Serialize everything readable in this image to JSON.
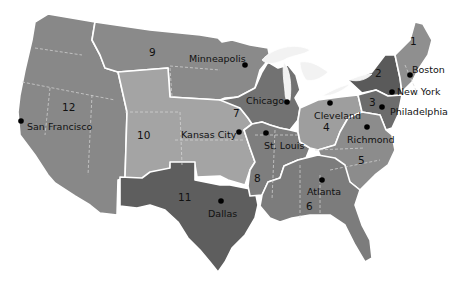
{
  "map": {
    "title": "Federal Reserve Districts",
    "colors": {
      "d1": "#8f8f8f",
      "d2": "#5a5a5a",
      "d3": "#6c6c6c",
      "d4": "#9e9e9e",
      "d5": "#8c8c8c",
      "d6": "#7c7c7c",
      "d7": "#727272",
      "d8": "#7e7e7e",
      "d9": "#8a8a8a",
      "d10": "#a4a4a4",
      "d11": "#5e5e5e",
      "d12": "#888888"
    },
    "districts": [
      {
        "number": "1",
        "city": "Boston"
      },
      {
        "number": "2",
        "city": "New York"
      },
      {
        "number": "3",
        "city": "Philadelphia"
      },
      {
        "number": "4",
        "city": "Cleveland"
      },
      {
        "number": "5",
        "city": "Richmond"
      },
      {
        "number": "6",
        "city": "Atlanta"
      },
      {
        "number": "7",
        "city": "Chicago"
      },
      {
        "number": "8",
        "city": "St. Louis"
      },
      {
        "number": "9",
        "city": "Minneapolis"
      },
      {
        "number": "10",
        "city": "Kansas City"
      },
      {
        "number": "11",
        "city": "Dallas"
      },
      {
        "number": "12",
        "city": "San Francisco"
      }
    ]
  }
}
